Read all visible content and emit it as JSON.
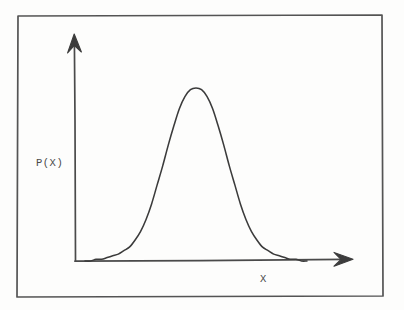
{
  "figure": {
    "kind": "hand-drawn-sketch",
    "title_visible": "",
    "background_color": "#fdfdfc",
    "frame": {
      "name": "outer-border-frame",
      "color": "#4f4f4f",
      "x": 17,
      "y": 15,
      "width": 366,
      "height": 282,
      "stroke_width": 1.6
    },
    "ink_color": "#3a3a3a",
    "axis_color": "#4a4a4a",
    "curve_color": "#3b3b3b"
  },
  "axes": {
    "y_axis": {
      "name": "y-axis",
      "label": "P(X)",
      "origin_x": 75,
      "origin_y": 261,
      "tip_x": 74,
      "tip_y": 35,
      "has_arrowhead": true,
      "ticks": [],
      "tick_labels": []
    },
    "x_axis": {
      "name": "x-axis",
      "label": "X",
      "origin_x": 75,
      "origin_y": 261,
      "tip_x": 352,
      "tip_y": 259,
      "has_arrowhead": true,
      "ticks": [],
      "tick_labels": []
    }
  },
  "chart_data": {
    "type": "line",
    "title": "",
    "subtitle": "",
    "xlabel": "X",
    "ylabel": "P(X)",
    "grid": false,
    "legend": false,
    "legend_position": "none",
    "annotations": [],
    "xlim": [
      0,
      10
    ],
    "ylim": [
      0,
      1.12
    ],
    "xticks": [],
    "yticks": [],
    "series": [
      {
        "name": "P(X)",
        "color": "#3b3b3b",
        "mean": 5.0,
        "sigma": 1.15,
        "peak_value": 1.0,
        "x": [
          0.0,
          0.25,
          0.5,
          0.75,
          1.0,
          1.25,
          1.5,
          1.75,
          2.0,
          2.25,
          2.5,
          2.75,
          3.0,
          3.25,
          3.5,
          3.75,
          4.0,
          4.25,
          4.5,
          4.75,
          5.0,
          5.25,
          5.5,
          5.75,
          6.0,
          6.25,
          6.5,
          6.75,
          7.0,
          7.25,
          7.5,
          7.75,
          8.0,
          8.25,
          8.5,
          8.75,
          9.0,
          9.25,
          9.5,
          9.75,
          10.0
        ],
        "values": [
          0.0,
          0.0,
          0.01,
          0.01,
          0.02,
          0.03,
          0.04,
          0.06,
          0.08,
          0.12,
          0.17,
          0.24,
          0.33,
          0.44,
          0.55,
          0.67,
          0.78,
          0.88,
          0.95,
          0.99,
          1.0,
          0.99,
          0.95,
          0.88,
          0.78,
          0.67,
          0.55,
          0.44,
          0.33,
          0.24,
          0.17,
          0.12,
          0.08,
          0.06,
          0.04,
          0.03,
          0.02,
          0.01,
          0.01,
          0.0,
          0.0
        ]
      }
    ],
    "pixel_geometry": {
      "baseline_y": 261,
      "peak_x": 198,
      "peak_y": 88,
      "left_tail_start_x": 85,
      "right_tail_end_x": 307,
      "path": "M 85,259 C 100,258 112,256 124,248 C 136,240 146,226 155,204 C 164,182 172,150 180,122 C 186,102 192,90 198,88 C 205,86 211,96 217,114 C 224,136 231,172 240,200 C 248,224 257,241 268,250 C 279,258 293,259 307,259"
    }
  },
  "labels": {
    "y_axis_label": "P(X)",
    "x_axis_label": "X"
  }
}
